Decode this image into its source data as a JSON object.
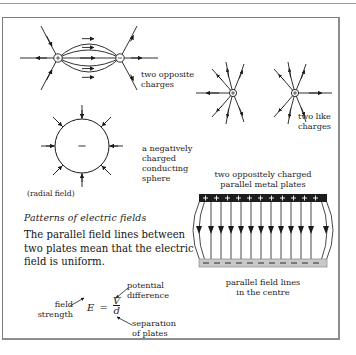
{
  "figure": {
    "title": "Patterns of electric fields",
    "body_text": "The parallel field lines between two plates mean that the electric field is uniform."
  },
  "diagrams": {
    "dipole": {
      "label": "two opposite charges",
      "positive_sign": "+",
      "negative_sign": "–"
    },
    "like_charges": {
      "label_line1": "two like",
      "label_line2": "charges",
      "sign_left": "+",
      "sign_right": "+"
    },
    "sphere": {
      "caption": "(radial field)",
      "label_line1": "a negatively",
      "label_line2": "charged",
      "label_line3": "conducting",
      "label_line4": "sphere",
      "charge_sign": "–"
    },
    "plates": {
      "title_line1": "two oppositely charged",
      "title_line2": "parallel metal plates",
      "caption_line1": "parallel field lines",
      "caption_line2": "in the centre",
      "top_plate_sign": "+",
      "bottom_plate_sign": "–",
      "top_plate_charge_count": 12,
      "bottom_plate_charge_count": 12,
      "field_line_count": 12
    }
  },
  "equation": {
    "symbol": "E",
    "equals": "=",
    "numerator": "V",
    "denominator": "d",
    "annotation_field_strength_line1": "field",
    "annotation_field_strength_line2": "strength",
    "annotation_potential_line1": "potential",
    "annotation_potential_line2": "difference",
    "annotation_separation_line1": "separation",
    "annotation_separation_line2": "of plates"
  },
  "colors": {
    "ink": "#1a1a1a",
    "frame": "#7d7d7d",
    "plate_positive": "#1c1c1c",
    "plate_negative": "#c9c9c9",
    "text": "#141414"
  }
}
